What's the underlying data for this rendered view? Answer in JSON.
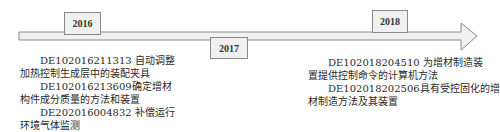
{
  "timeline": {
    "direction": "left-to-right",
    "years": [
      {
        "label": "2016"
      },
      {
        "label": "2017"
      },
      {
        "label": "2018"
      }
    ]
  },
  "entries": {
    "left_2016": [
      {
        "line1": "DE102016211313 自动调整",
        "line2": "加热控制生成层中的装配夹具"
      },
      {
        "line1": "DE102016213609确定增材",
        "line2": "构件成分质量的方法和装置"
      },
      {
        "line1": "DE202016004832 补偿运行",
        "line2": "环境气体监测"
      }
    ],
    "right_2018": [
      {
        "line1": "DE102018204510 为增材制造装",
        "line2": "置提供控制命令的计算机方法"
      },
      {
        "line1": "DE102018202506具有受控固化的增",
        "line2": "材制造方法及其装置"
      }
    ]
  },
  "colors": {
    "arrow_fill": "#f0f0f0",
    "arrow_stroke": "#8a8a8a",
    "box_fill": "#f0f0f0",
    "text": "#2a2a2a"
  }
}
